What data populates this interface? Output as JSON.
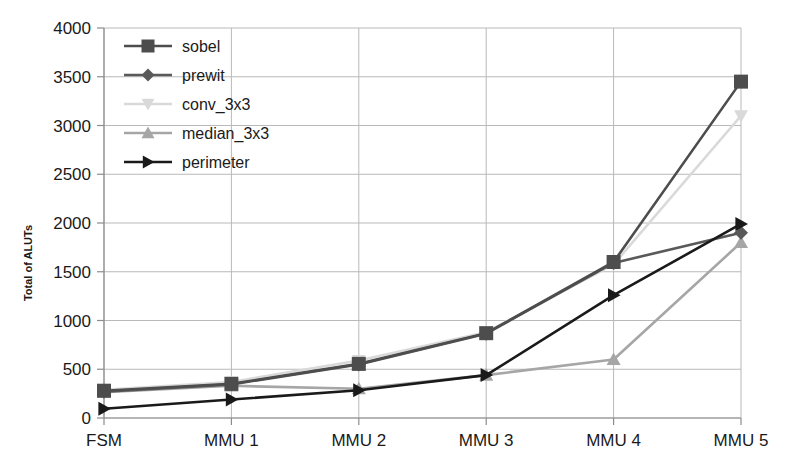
{
  "chart_data": {
    "type": "line",
    "title": "",
    "xlabel": "",
    "ylabel": "Total of ALUTs",
    "categories": [
      "FSM",
      "MMU 1",
      "MMU 2",
      "MMU 3",
      "MMU 4",
      "MMU 5"
    ],
    "ylim": [
      0,
      4000
    ],
    "yticks": [
      0,
      500,
      1000,
      1500,
      2000,
      2500,
      3000,
      3500,
      4000
    ],
    "ytick_labels": [
      "0",
      "500",
      "1000",
      "1500",
      "2000",
      "2500",
      "3000",
      "3500",
      "4000"
    ],
    "grid": true,
    "legend_position": "upper-left-inside",
    "series": [
      {
        "name": "sobel",
        "marker": "square",
        "color": "#4d4d4d",
        "values": [
          280,
          350,
          555,
          870,
          1600,
          3450
        ]
      },
      {
        "name": "prewit",
        "marker": "diamond",
        "color": "#595959",
        "values": [
          270,
          345,
          550,
          865,
          1590,
          1900
        ]
      },
      {
        "name": "conv_3x3",
        "marker": "triangle-down",
        "color": "#d9d9d9",
        "values": [
          290,
          370,
          590,
          880,
          1575,
          3100
        ]
      },
      {
        "name": "median_3x3",
        "marker": "triangle-up",
        "color": "#a6a6a6",
        "values": [
          265,
          330,
          300,
          440,
          600,
          1800
        ]
      },
      {
        "name": "perimeter",
        "marker": "triangle-right",
        "color": "#1a1a1a",
        "values": [
          95,
          190,
          285,
          440,
          1260,
          1990
        ]
      }
    ]
  },
  "legend": {
    "items": [
      {
        "label": "sobel"
      },
      {
        "label": "prewit"
      },
      {
        "label": "conv_3x3"
      },
      {
        "label": "median_3x3"
      },
      {
        "label": "perimeter"
      }
    ]
  }
}
